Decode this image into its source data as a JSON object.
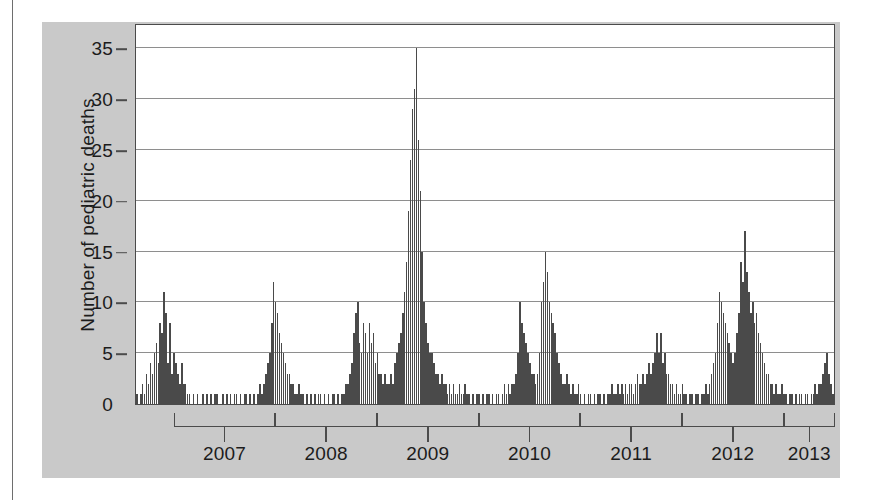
{
  "chart_data": {
    "type": "bar",
    "title": "",
    "xlabel": "",
    "ylabel": "Number of pediatric deaths",
    "ylim": [
      0,
      37.5
    ],
    "yticks": [
      0,
      5,
      10,
      15,
      20,
      25,
      30,
      35
    ],
    "ytick_labels": [
      "0",
      "5",
      "10",
      "15",
      "20",
      "25",
      "30",
      "35"
    ],
    "grid": "horizontal",
    "legend": "none",
    "x_group_labels": [
      "2007",
      "2008",
      "2009",
      "2010",
      "2011",
      "2012",
      "2013"
    ],
    "x_description": "Weekly counts, brackets delimit calendar years 2007 through 2013",
    "bar_color": "#4a4a4a",
    "x_start_year_fraction": 2006.62,
    "weeks_per_year": 52,
    "values": [
      1,
      0,
      1,
      2,
      1,
      3,
      2,
      4,
      3,
      5,
      6,
      4,
      8,
      7,
      11,
      9,
      4,
      8,
      3,
      5,
      4,
      3,
      2,
      4,
      2,
      2,
      1,
      1,
      0,
      1,
      0,
      1,
      0,
      0,
      1,
      0,
      1,
      0,
      1,
      0,
      1,
      1,
      0,
      0,
      1,
      0,
      1,
      0,
      1,
      0,
      1,
      1,
      0,
      1,
      0,
      1,
      1,
      0,
      1,
      0,
      1,
      0,
      1,
      2,
      1,
      2,
      3,
      4,
      5,
      8,
      12,
      10,
      9,
      7,
      6,
      5,
      4,
      3,
      3,
      2,
      2,
      1,
      1,
      2,
      1,
      1,
      0,
      1,
      0,
      1,
      0,
      1,
      0,
      1,
      1,
      0,
      1,
      0,
      1,
      0,
      1,
      1,
      0,
      1,
      0,
      1,
      1,
      2,
      2,
      3,
      4,
      7,
      9,
      10,
      6,
      5,
      8,
      7,
      5,
      8,
      6,
      7,
      4,
      5,
      3,
      3,
      2,
      3,
      2,
      2,
      3,
      2,
      4,
      5,
      6,
      7,
      9,
      11,
      14,
      19,
      24,
      29,
      31,
      35,
      26,
      21,
      15,
      10,
      8,
      6,
      5,
      5,
      4,
      3,
      3,
      2,
      3,
      2,
      2,
      1,
      2,
      1,
      2,
      1,
      1,
      2,
      1,
      1,
      2,
      1,
      1,
      0,
      1,
      0,
      1,
      1,
      0,
      1,
      0,
      1,
      1,
      0,
      1,
      0,
      1,
      1,
      0,
      1,
      2,
      1,
      2,
      1,
      2,
      2,
      3,
      5,
      10,
      8,
      7,
      6,
      5,
      4,
      3,
      3,
      2,
      3,
      5,
      10,
      12,
      15,
      13,
      10,
      9,
      8,
      7,
      5,
      4,
      3,
      2,
      2,
      3,
      2,
      1,
      2,
      1,
      1,
      2,
      1,
      0,
      1,
      0,
      1,
      1,
      0,
      1,
      0,
      1,
      1,
      0,
      1,
      0,
      1,
      1,
      2,
      1,
      1,
      2,
      1,
      2,
      1,
      2,
      1,
      2,
      2,
      1,
      2,
      3,
      2,
      2,
      3,
      2,
      3,
      4,
      3,
      4,
      5,
      7,
      5,
      7,
      4,
      5,
      3,
      3,
      2,
      2,
      1,
      2,
      1,
      1,
      2,
      1,
      1,
      0,
      1,
      1,
      0,
      1,
      1,
      0,
      1,
      1,
      2,
      1,
      2,
      3,
      4,
      5,
      8,
      11,
      10,
      9,
      8,
      7,
      6,
      5,
      4,
      5,
      7,
      9,
      14,
      12,
      17,
      13,
      11,
      9,
      10,
      8,
      9,
      7,
      6,
      5,
      4,
      3,
      3,
      2,
      2,
      1,
      2,
      1,
      1,
      2,
      1,
      1,
      0,
      1,
      1,
      0,
      1,
      0,
      1,
      1,
      0,
      1,
      1,
      0,
      1,
      1,
      2,
      1,
      2,
      2,
      3,
      4,
      5,
      3,
      2,
      1,
      1
    ]
  }
}
